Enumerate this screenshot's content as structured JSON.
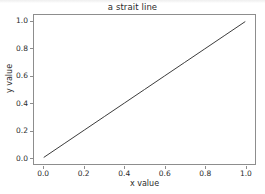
{
  "figure": {
    "background_color": "#ffffff",
    "width": 265,
    "height": 194
  },
  "chart_data": {
    "type": "line",
    "title": "a strait line",
    "xlabel": "x value",
    "ylabel": "y value",
    "xlim": [
      -0.05,
      1.05
    ],
    "ylim": [
      -0.05,
      1.05
    ],
    "grid": false,
    "legend": null,
    "xticks": [
      0.0,
      0.2,
      0.4,
      0.6,
      0.8,
      1.0
    ],
    "yticks": [
      0.0,
      0.2,
      0.4,
      0.6,
      0.8,
      1.0
    ],
    "xticklabels": [
      "0.0",
      "0.2",
      "0.4",
      "0.6",
      "0.8",
      "1.0"
    ],
    "yticklabels": [
      "0.0",
      "0.2",
      "0.4",
      "0.6",
      "0.8",
      "1.0"
    ],
    "series": [
      {
        "name": "y = x",
        "color": "#3a3a3a",
        "linewidth": 1,
        "x": [
          0.0,
          0.1,
          0.2,
          0.3,
          0.4,
          0.5,
          0.6,
          0.7,
          0.8,
          0.9,
          1.0
        ],
        "y": [
          0.0,
          0.1,
          0.2,
          0.3,
          0.4,
          0.5,
          0.6,
          0.7,
          0.8,
          0.9,
          1.0
        ]
      }
    ]
  },
  "axes_style": {
    "spine_color": "#8d8d8d",
    "tick_color": "#8d8d8d",
    "text_color": "#2b2b2b",
    "plot_background": "#ffffff"
  }
}
